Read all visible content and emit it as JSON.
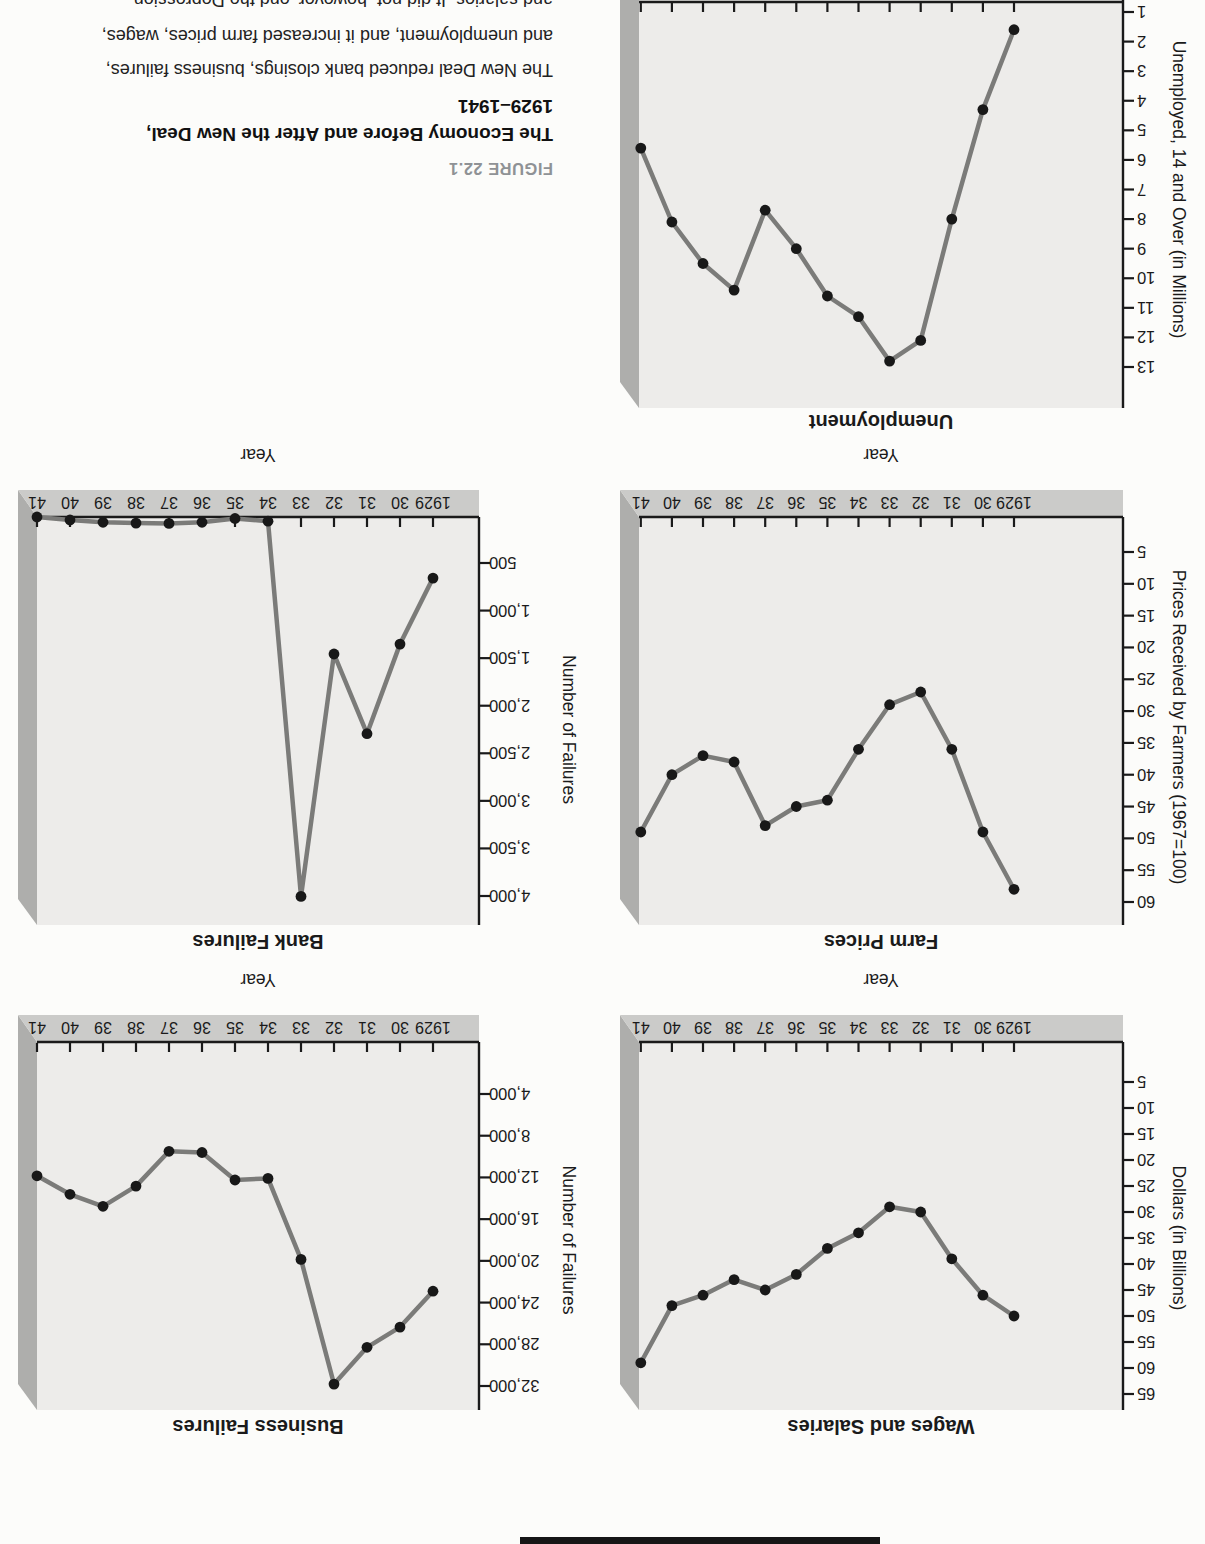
{
  "figure_caption": {
    "label": "FIGURE 22.1",
    "title": "The Economy Before and After the New Deal,",
    "title_dates": "1929–1941",
    "body_line1": "The New Deal reduced bank closings, business failures,",
    "body_line2": "and unemployment, and it increased farm prices, wages,",
    "body_line3_clipped": "and salaries. It did not, however, end the Depression."
  },
  "shared_axis": {
    "xlabel": "Year",
    "categories": [
      "1929",
      "30",
      "31",
      "32",
      "33",
      "34",
      "35",
      "36",
      "37",
      "38",
      "39",
      "40",
      "41"
    ]
  },
  "chart_data": [
    {
      "id": "wages",
      "type": "line",
      "title": "Wages and Salaries",
      "ylabel": "Dollars (in Billions)",
      "xlabel": "Year",
      "categories": [
        "1929",
        "30",
        "31",
        "32",
        "33",
        "34",
        "35",
        "36",
        "37",
        "38",
        "39",
        "40",
        "41"
      ],
      "values": [
        50,
        46,
        39,
        30,
        29,
        34,
        37,
        42,
        45,
        43,
        46,
        48,
        59
      ],
      "yticks": [
        5,
        10,
        15,
        20,
        25,
        30,
        35,
        40,
        45,
        50,
        55,
        60,
        65
      ],
      "ytick_labels": [
        "5",
        "10",
        "15",
        "20",
        "25",
        "30",
        "35",
        "40",
        "45",
        "50",
        "55",
        "60",
        "65"
      ],
      "ylim": [
        5,
        65
      ],
      "grid": false
    },
    {
      "id": "business_failures",
      "type": "line",
      "title": "Business Failures",
      "ylabel": "Number of Failures",
      "xlabel": "Year",
      "categories": [
        "1929",
        "30",
        "31",
        "32",
        "33",
        "34",
        "35",
        "36",
        "37",
        "38",
        "39",
        "40",
        "41"
      ],
      "values": [
        22909,
        26355,
        28285,
        31822,
        19859,
        12091,
        12244,
        9607,
        9490,
        12836,
        14768,
        13619,
        11848
      ],
      "yticks": [
        4000,
        8000,
        12000,
        16000,
        20000,
        24000,
        28000,
        32000
      ],
      "ytick_labels": [
        "4,000",
        "8,000",
        "12,000",
        "16,000",
        "20,000",
        "24,000",
        "28,000",
        "32,000"
      ],
      "ylim": [
        4000,
        32000
      ],
      "grid": false
    },
    {
      "id": "farm_prices",
      "type": "line",
      "title": "Farm Prices",
      "ylabel": "Prices Received by Farmers (1967=100)",
      "xlabel": "Year",
      "categories": [
        "1929",
        "30",
        "31",
        "32",
        "33",
        "34",
        "35",
        "36",
        "37",
        "38",
        "39",
        "40",
        "41"
      ],
      "values": [
        58,
        49,
        36,
        27,
        29,
        36,
        44,
        45,
        48,
        38,
        37,
        40,
        49
      ],
      "yticks": [
        5,
        10,
        15,
        20,
        25,
        30,
        35,
        40,
        45,
        50,
        55,
        60
      ],
      "ytick_labels": [
        "5",
        "10",
        "15",
        "20",
        "25",
        "30",
        "35",
        "40",
        "45",
        "50",
        "55",
        "60"
      ],
      "ylim": [
        5,
        60
      ],
      "grid": false
    },
    {
      "id": "bank_failures",
      "type": "line",
      "title": "Bank Failures",
      "ylabel": "Number of Failures",
      "xlabel": "Year",
      "categories": [
        "1929",
        "30",
        "31",
        "32",
        "33",
        "34",
        "35",
        "36",
        "37",
        "38",
        "39",
        "40",
        "41"
      ],
      "values": [
        659,
        1352,
        2294,
        1456,
        4004,
        61,
        32,
        72,
        84,
        81,
        72,
        48,
        17
      ],
      "yticks": [
        500,
        1000,
        1500,
        2000,
        2500,
        3000,
        3500,
        4000
      ],
      "ytick_labels": [
        "500",
        "1,000",
        "1,500",
        "2,000",
        "2,500",
        "3,000",
        "3,500",
        "4,000"
      ],
      "ylim": [
        500,
        4000
      ],
      "grid": false
    },
    {
      "id": "unemployment",
      "type": "line",
      "title": "Unemployment",
      "ylabel": "Unemployed, 14 and Over (in Millions)",
      "xlabel": null,
      "x_axis_cut_off": true,
      "categories": [
        "1929",
        "30",
        "31",
        "32",
        "33",
        "34",
        "35",
        "36",
        "37",
        "38",
        "39",
        "40",
        "41"
      ],
      "values": [
        1.6,
        4.3,
        8.0,
        12.1,
        12.8,
        11.3,
        10.6,
        9.0,
        7.7,
        10.4,
        9.5,
        8.1,
        5.6
      ],
      "yticks": [
        1,
        2,
        3,
        4,
        5,
        6,
        7,
        8,
        9,
        10,
        11,
        12,
        13
      ],
      "ytick_labels": [
        "1",
        "2",
        "3",
        "4",
        "5",
        "6",
        "7",
        "8",
        "9",
        "10",
        "11",
        "12",
        "13"
      ],
      "ylim": [
        1,
        13
      ],
      "grid": false
    }
  ],
  "colors": {
    "page": "#fcfcfa",
    "panel": "#edecea",
    "band": "#cbcbc9",
    "side": "#aeaeac",
    "axis": "#1a1a1a",
    "line": "#7b7b79",
    "dot": "#181818",
    "figure_label": "#8f9295"
  }
}
